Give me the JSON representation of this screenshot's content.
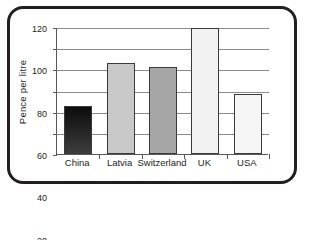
{
  "chart_data": {
    "type": "bar",
    "title": "",
    "xlabel": "",
    "ylabel": "Pence per litre",
    "categories": [
      "China",
      "Latvia",
      "Switzerland",
      "UK",
      "USA"
    ],
    "values": [
      45,
      86,
      82,
      119,
      57
    ],
    "ylim": [
      0,
      120
    ],
    "ytick_labels": [
      "0",
      "20",
      "40",
      "60",
      "80",
      "100",
      "120"
    ],
    "ytick_values": [
      0,
      20,
      40,
      60,
      80,
      100,
      120
    ],
    "grid": true,
    "legend": false,
    "bar_colors": [
      "#1a1a1a",
      "#c9c9c9",
      "#a6a6a6",
      "#f2f2f2",
      "#f5f5f5"
    ],
    "bar_edge_color": "#3a3a3c",
    "series": [
      {
        "name": "Pence per litre",
        "values": [
          45,
          86,
          82,
          119,
          57
        ]
      }
    ]
  },
  "frame": {
    "border_color": "#231f20",
    "background": "#ffffff"
  },
  "axis": {
    "line_color": "#58595b",
    "grid_color": "#8a8c8e",
    "text_color": "#231f20"
  }
}
